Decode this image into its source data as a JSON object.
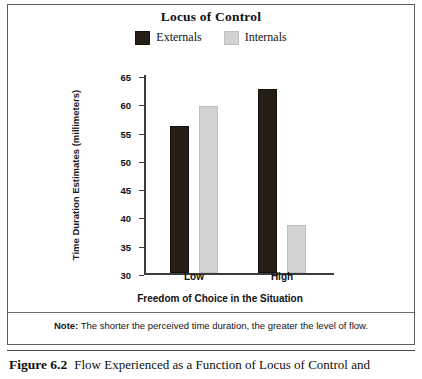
{
  "chart_data": {
    "type": "bar",
    "title": "Locus of Control",
    "xlabel": "Freedom of Choice in the Situation",
    "ylabel": "Time Duration Estimates (millimeters)",
    "categories": [
      "Low",
      "High"
    ],
    "series": [
      {
        "name": "Externals",
        "color": "#241e17",
        "values": [
          56,
          62.5
        ]
      },
      {
        "name": "Internals",
        "color": "#d2d2d2",
        "values": [
          59.5,
          38.5
        ]
      }
    ],
    "ylim": [
      30,
      65
    ],
    "yticks": [
      65,
      60,
      55,
      50,
      45,
      40,
      35,
      30
    ],
    "grid": false,
    "legend_position": "top"
  },
  "note": {
    "label": "Note:",
    "text": "The shorter the perceived time duration, the greater the level of flow."
  },
  "caption": {
    "number": "Figure 6.2",
    "text": "Flow Experienced as a Function of Locus of Control and"
  }
}
